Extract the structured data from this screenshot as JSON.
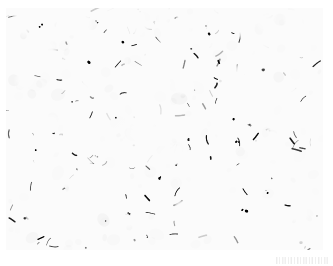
{
  "page": {
    "width": 333,
    "height": 266,
    "background_color": "#ffffff",
    "kind": "scanned-journal-figure",
    "caption_text": "",
    "title": "Histopathology micrograph"
  },
  "figure": {
    "name": "histology-micrograph",
    "stain": "hematoxylin-and-eosin",
    "rendering": "halftone-bitonal-scan",
    "bounds": {
      "left": 6,
      "top": 8,
      "width": 317,
      "height": 242
    },
    "colors": {
      "background": "#ffffff",
      "stain_dark": "#101010",
      "stain_mid": "#4a4a4a",
      "stain_light": "#9a9a9a",
      "paper": "#ffffff"
    },
    "texture": {
      "nuclei_count": 5200,
      "nucleus_min_radius": 0.6,
      "nucleus_max_radius": 2.6,
      "seed": 20240517,
      "dark_fraction": 0.46,
      "contrast": 1.85,
      "grain_opacity": 0.55
    },
    "lacunae": [
      {
        "cx": 0.055,
        "cy": 0.05,
        "rx": 0.03,
        "ry": 0.06,
        "rot": -8
      },
      {
        "cx": 0.16,
        "cy": 0.04,
        "rx": 0.034,
        "ry": 0.052,
        "rot": 6
      },
      {
        "cx": 0.243,
        "cy": 0.055,
        "rx": 0.026,
        "ry": 0.065,
        "rot": -4
      },
      {
        "cx": 0.33,
        "cy": 0.038,
        "rx": 0.022,
        "ry": 0.048,
        "rot": 10
      },
      {
        "cx": 0.415,
        "cy": 0.06,
        "rx": 0.03,
        "ry": 0.07,
        "rot": -6
      },
      {
        "cx": 0.5,
        "cy": 0.035,
        "rx": 0.024,
        "ry": 0.05,
        "rot": 3
      },
      {
        "cx": 0.56,
        "cy": 0.065,
        "rx": 0.02,
        "ry": 0.058,
        "rot": -9
      },
      {
        "cx": 0.65,
        "cy": 0.042,
        "rx": 0.026,
        "ry": 0.055,
        "rot": 5
      },
      {
        "cx": 0.735,
        "cy": 0.055,
        "rx": 0.022,
        "ry": 0.062,
        "rot": -3
      },
      {
        "cx": 0.82,
        "cy": 0.04,
        "rx": 0.028,
        "ry": 0.05,
        "rot": 8
      },
      {
        "cx": 0.905,
        "cy": 0.06,
        "rx": 0.026,
        "ry": 0.066,
        "rot": -5
      },
      {
        "cx": 0.965,
        "cy": 0.038,
        "rx": 0.02,
        "ry": 0.046,
        "rot": 4
      },
      {
        "cx": 0.12,
        "cy": 0.165,
        "rx": 0.038,
        "ry": 0.042,
        "rot": 15
      },
      {
        "cx": 0.3,
        "cy": 0.15,
        "rx": 0.03,
        "ry": 0.036,
        "rot": -12
      },
      {
        "cx": 0.47,
        "cy": 0.175,
        "rx": 0.042,
        "ry": 0.04,
        "rot": 20
      },
      {
        "cx": 0.64,
        "cy": 0.145,
        "rx": 0.026,
        "ry": 0.034,
        "rot": -7
      },
      {
        "cx": 0.79,
        "cy": 0.185,
        "rx": 0.046,
        "ry": 0.058,
        "rot": 12
      },
      {
        "cx": 0.93,
        "cy": 0.16,
        "rx": 0.034,
        "ry": 0.044,
        "rot": -10
      },
      {
        "cx": 0.06,
        "cy": 0.3,
        "rx": 0.03,
        "ry": 0.034,
        "rot": 5
      },
      {
        "cx": 0.25,
        "cy": 0.33,
        "rx": 0.026,
        "ry": 0.03,
        "rot": -8
      },
      {
        "cx": 0.56,
        "cy": 0.32,
        "rx": 0.032,
        "ry": 0.036,
        "rot": 10
      },
      {
        "cx": 0.745,
        "cy": 0.3,
        "rx": 0.04,
        "ry": 0.062,
        "rot": -6
      },
      {
        "cx": 0.9,
        "cy": 0.355,
        "rx": 0.03,
        "ry": 0.038,
        "rot": 14
      },
      {
        "cx": 0.14,
        "cy": 0.47,
        "rx": 0.028,
        "ry": 0.03,
        "rot": -5
      },
      {
        "cx": 0.43,
        "cy": 0.52,
        "rx": 0.052,
        "ry": 0.046,
        "rot": 8
      },
      {
        "cx": 0.52,
        "cy": 0.6,
        "rx": 0.044,
        "ry": 0.038,
        "rot": -14
      },
      {
        "cx": 0.69,
        "cy": 0.56,
        "rx": 0.03,
        "ry": 0.034,
        "rot": 6
      },
      {
        "cx": 0.86,
        "cy": 0.5,
        "rx": 0.034,
        "ry": 0.04,
        "rot": -9
      },
      {
        "cx": 0.08,
        "cy": 0.66,
        "rx": 0.03,
        "ry": 0.032,
        "rot": 11
      },
      {
        "cx": 0.285,
        "cy": 0.7,
        "rx": 0.036,
        "ry": 0.032,
        "rot": -6
      },
      {
        "cx": 0.61,
        "cy": 0.72,
        "rx": 0.03,
        "ry": 0.034,
        "rot": 7
      },
      {
        "cx": 0.8,
        "cy": 0.68,
        "rx": 0.028,
        "ry": 0.03,
        "rot": -11
      },
      {
        "cx": 0.18,
        "cy": 0.85,
        "rx": 0.034,
        "ry": 0.03,
        "rot": 9
      },
      {
        "cx": 0.38,
        "cy": 0.88,
        "rx": 0.028,
        "ry": 0.026,
        "rot": -5
      },
      {
        "cx": 0.56,
        "cy": 0.83,
        "rx": 0.03,
        "ry": 0.034,
        "rot": 12
      },
      {
        "cx": 0.72,
        "cy": 0.9,
        "rx": 0.032,
        "ry": 0.028,
        "rot": -8
      },
      {
        "cx": 0.925,
        "cy": 0.845,
        "rx": 0.03,
        "ry": 0.036,
        "rot": 6
      }
    ],
    "pale_center": {
      "cx": 0.47,
      "cy": 0.56,
      "rx": 0.17,
      "ry": 0.15,
      "strength": 0.55
    }
  },
  "artifact": {
    "name": "scan-smudge",
    "left": 276,
    "top": 257,
    "width": 54,
    "height": 7,
    "opacity": 0.2
  }
}
